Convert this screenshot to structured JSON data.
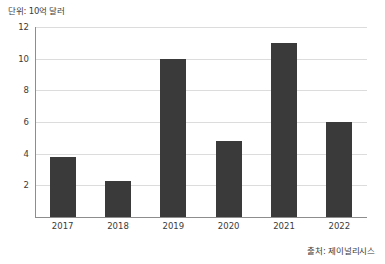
{
  "chart_data": {
    "type": "bar",
    "title": "",
    "unit_caption": "단위: 10억 달러",
    "source_note": "출처: 제이널리시스",
    "categories": [
      "2017",
      "2018",
      "2019",
      "2020",
      "2021",
      "2022"
    ],
    "values": [
      3.8,
      2.3,
      10.0,
      4.8,
      11.0,
      6.0
    ],
    "series": [
      {
        "name": "값",
        "values": [
          3.8,
          2.3,
          10.0,
          4.8,
          11.0,
          6.0
        ]
      }
    ],
    "xlabel": "",
    "ylabel": "",
    "ylim": [
      0,
      12
    ],
    "yticks": [
      2,
      4,
      6,
      8,
      10,
      12
    ],
    "ytick_labels": [
      "2",
      "4",
      "6",
      "8",
      "10",
      "12"
    ],
    "grid": true,
    "grid_axis": "y",
    "legend": false,
    "legend_position": "none",
    "bar_color": "#3a3a3a",
    "grid_color": "#dcdcdc",
    "axis_color": "#8d8d8d",
    "background_color": "#ffffff",
    "text_color": "#3b3b3b"
  }
}
